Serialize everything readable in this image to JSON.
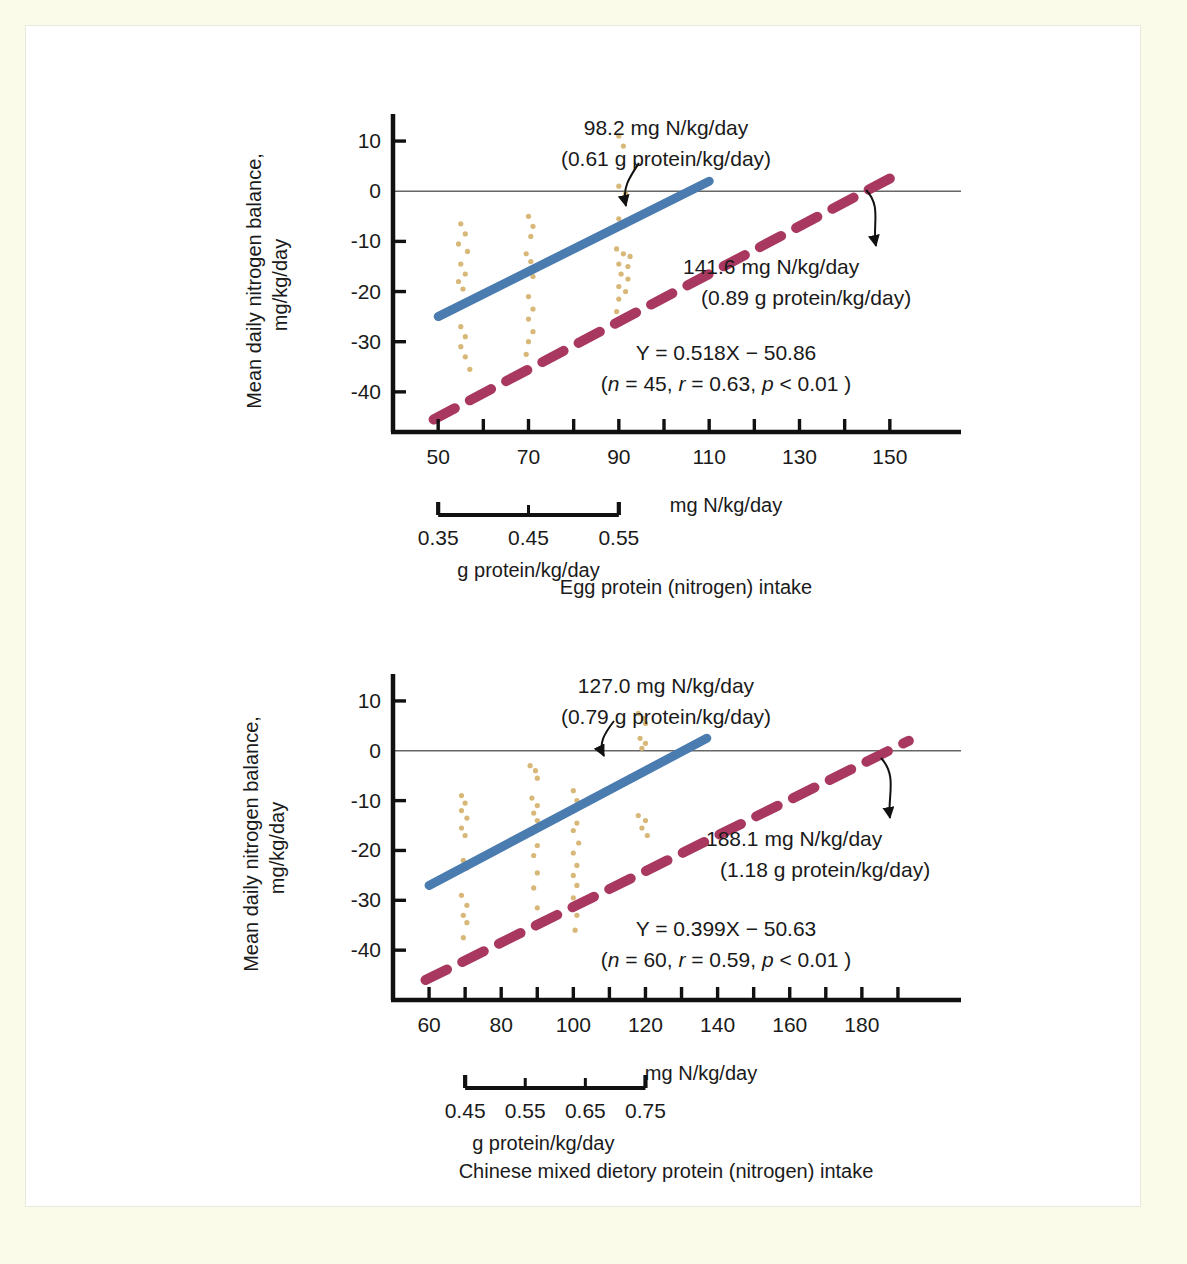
{
  "figure": {
    "background_outer": "#fbfbe9",
    "background_inner": "#ffffff",
    "colors": {
      "line_solid_blue": "#4b7cb0",
      "line_dashed_magenta": "#a8385f",
      "scatter_points": "#d8b878",
      "axis": "#111111",
      "zero_line": "#666666",
      "text": "#1a1a1a"
    }
  },
  "chart_data": [
    {
      "id": "egg-protein",
      "type": "scatter",
      "title": "",
      "caption": "Egg protein (nitrogen) intake",
      "xlabel": "mg N/kg/day",
      "ylabel": "Mean daily nitrogen balance,",
      "ylabel2": "mg/kg/day",
      "xlim": [
        40,
        160
      ],
      "ylim": [
        -48,
        14
      ],
      "x_ticks": [
        50,
        60,
        70,
        80,
        90,
        100,
        110,
        120,
        130,
        140,
        150
      ],
      "x_tick_labels": [
        "50",
        "",
        "70",
        "",
        "90",
        "",
        "110",
        "",
        "130",
        "",
        "150"
      ],
      "y_ticks": [
        10,
        0,
        -10,
        -20,
        -30,
        -40
      ],
      "y_tick_labels": [
        "10",
        "0",
        "-10",
        "-20",
        "-30",
        "-40"
      ],
      "secondary_axis": {
        "label": "g protein/kg/day",
        "ticks": [
          0.35,
          0.45,
          0.55
        ],
        "tick_labels": [
          "0.35",
          "0.45",
          "0.55"
        ],
        "x_start": 50,
        "x_end": 90
      },
      "grid": false,
      "zero_line": true,
      "series": [
        {
          "name": "regression-solid",
          "style": "solid",
          "color": "#4b7cb0",
          "x": [
            50,
            110
          ],
          "y": [
            -25.0,
            2.0
          ]
        },
        {
          "name": "regression-dashed",
          "style": "dashed",
          "color": "#a8385f",
          "x": [
            49,
            152
          ],
          "y": [
            -45.5,
            3.5
          ]
        }
      ],
      "points": [
        {
          "x": 55,
          "y": -6.5
        },
        {
          "x": 56,
          "y": -8.5
        },
        {
          "x": 54.5,
          "y": -10.5
        },
        {
          "x": 56.5,
          "y": -12.0
        },
        {
          "x": 55,
          "y": -14.5
        },
        {
          "x": 56,
          "y": -16.5
        },
        {
          "x": 54.5,
          "y": -18.0
        },
        {
          "x": 55.5,
          "y": -19.5
        },
        {
          "x": 55,
          "y": -27.0
        },
        {
          "x": 56,
          "y": -29.0
        },
        {
          "x": 55,
          "y": -31.0
        },
        {
          "x": 56,
          "y": -33.0
        },
        {
          "x": 57,
          "y": -35.5
        },
        {
          "x": 70,
          "y": -5.0
        },
        {
          "x": 71,
          "y": -7.0
        },
        {
          "x": 70.5,
          "y": -9.0
        },
        {
          "x": 69.5,
          "y": -12.5
        },
        {
          "x": 70.5,
          "y": -14.0
        },
        {
          "x": 71,
          "y": -17.0
        },
        {
          "x": 70,
          "y": -21.0
        },
        {
          "x": 71,
          "y": -23.5
        },
        {
          "x": 70,
          "y": -25.5
        },
        {
          "x": 71,
          "y": -28.0
        },
        {
          "x": 70,
          "y": -30.0
        },
        {
          "x": 69.5,
          "y": -32.5
        },
        {
          "x": 90,
          "y": 11.0
        },
        {
          "x": 91,
          "y": 9.0
        },
        {
          "x": 90,
          "y": 1.0
        },
        {
          "x": 91.5,
          "y": -0.5
        },
        {
          "x": 90,
          "y": -5.5
        },
        {
          "x": 91,
          "y": -7.0
        },
        {
          "x": 89.5,
          "y": -11.5
        },
        {
          "x": 91,
          "y": -12.5
        },
        {
          "x": 92.5,
          "y": -13.0
        },
        {
          "x": 90,
          "y": -14.5
        },
        {
          "x": 92,
          "y": -15.0
        },
        {
          "x": 90.5,
          "y": -16.5
        },
        {
          "x": 92,
          "y": -17.5
        },
        {
          "x": 90,
          "y": -19.0
        },
        {
          "x": 91.5,
          "y": -20.0
        },
        {
          "x": 90,
          "y": -21.5
        },
        {
          "x": 89.5,
          "y": -24.0
        },
        {
          "x": 91,
          "y": -25.0
        },
        {
          "x": 90,
          "y": -26.5
        }
      ],
      "annotations": [
        {
          "name": "solid-line-intercept",
          "line1": "98.2 mg N/kg/day",
          "line2": "(0.61 g protein/kg/day)"
        },
        {
          "name": "dashed-line-intercept",
          "line1": "141.6 mg N/kg/day",
          "line2": "(0.89 g protein/kg/day)"
        }
      ],
      "equation": {
        "line1": "Y = 0.518X − 50.86",
        "line2_prefix": "(",
        "n_symbol": "n",
        "n_value": " = 45, ",
        "r_symbol": "r",
        "r_value": " = 0.63, ",
        "p_symbol": "p",
        "p_value": " < 0.01 )"
      }
    },
    {
      "id": "chinese-mixed-diet",
      "type": "scatter",
      "title": "",
      "caption": "Chinese mixed dietory protein (nitrogen) intake",
      "xlabel": "mg N/kg/day",
      "ylabel": "Mean daily nitrogen balance,",
      "ylabel2": "mg/kg/day",
      "xlim": [
        50,
        200
      ],
      "ylim": [
        -50,
        14
      ],
      "x_ticks": [
        60,
        70,
        80,
        90,
        100,
        110,
        120,
        130,
        140,
        150,
        160,
        170,
        180,
        190
      ],
      "x_tick_labels": [
        "60",
        "",
        "80",
        "",
        "100",
        "",
        "120",
        "",
        "140",
        "",
        "160",
        "",
        "180",
        ""
      ],
      "y_ticks": [
        10,
        0,
        -10,
        -20,
        -30,
        -40
      ],
      "y_tick_labels": [
        "10",
        "0",
        "-10",
        "-20",
        "-30",
        "-40"
      ],
      "secondary_axis": {
        "label": "g protein/kg/day",
        "ticks": [
          0.45,
          0.55,
          0.65,
          0.75
        ],
        "tick_labels": [
          "0.45",
          "0.55",
          "0.65",
          "0.75"
        ],
        "x_start": 70,
        "x_end": 120
      },
      "grid": false,
      "zero_line": true,
      "series": [
        {
          "name": "regression-solid",
          "style": "solid",
          "color": "#4b7cb0",
          "x": [
            60,
            137
          ],
          "y": [
            -27.0,
            2.5
          ]
        },
        {
          "name": "regression-dashed",
          "style": "dashed",
          "color": "#a8385f",
          "x": [
            59,
            193
          ],
          "y": [
            -46.0,
            2.0
          ]
        }
      ],
      "points": [
        {
          "x": 69,
          "y": -9.0
        },
        {
          "x": 70,
          "y": -10.5
        },
        {
          "x": 69,
          "y": -12.0
        },
        {
          "x": 70.5,
          "y": -13.5
        },
        {
          "x": 69,
          "y": -15.5
        },
        {
          "x": 70,
          "y": -17.0
        },
        {
          "x": 69.5,
          "y": -22.0
        },
        {
          "x": 70.5,
          "y": -23.5
        },
        {
          "x": 69,
          "y": -29.0
        },
        {
          "x": 70.5,
          "y": -31.0
        },
        {
          "x": 69.5,
          "y": -33.0
        },
        {
          "x": 70.5,
          "y": -34.5
        },
        {
          "x": 69.5,
          "y": -37.5
        },
        {
          "x": 88,
          "y": -3.0
        },
        {
          "x": 89.5,
          "y": -4.0
        },
        {
          "x": 90,
          "y": -5.5
        },
        {
          "x": 88.5,
          "y": -9.5
        },
        {
          "x": 90,
          "y": -11.0
        },
        {
          "x": 89,
          "y": -12.5
        },
        {
          "x": 90,
          "y": -14.0
        },
        {
          "x": 88.5,
          "y": -16.5
        },
        {
          "x": 90,
          "y": -19.0
        },
        {
          "x": 89,
          "y": -21.0
        },
        {
          "x": 90,
          "y": -24.5
        },
        {
          "x": 89,
          "y": -27.5
        },
        {
          "x": 90,
          "y": -31.5
        },
        {
          "x": 100,
          "y": -8.0
        },
        {
          "x": 101,
          "y": -10.0
        },
        {
          "x": 100,
          "y": -12.0
        },
        {
          "x": 101,
          "y": -14.5
        },
        {
          "x": 100,
          "y": -16.0
        },
        {
          "x": 101.5,
          "y": -18.5
        },
        {
          "x": 100,
          "y": -20.5
        },
        {
          "x": 101,
          "y": -23.0
        },
        {
          "x": 100,
          "y": -25.0
        },
        {
          "x": 101,
          "y": -27.0
        },
        {
          "x": 100,
          "y": -29.5
        },
        {
          "x": 101,
          "y": -33.0
        },
        {
          "x": 100.5,
          "y": -36.0
        },
        {
          "x": 118,
          "y": 7.5
        },
        {
          "x": 119.5,
          "y": 6.5
        },
        {
          "x": 120,
          "y": 5.5
        },
        {
          "x": 118.5,
          "y": 2.5
        },
        {
          "x": 120,
          "y": 1.5
        },
        {
          "x": 119,
          "y": 0.5
        },
        {
          "x": 118,
          "y": -13.0
        },
        {
          "x": 120,
          "y": -14.0
        },
        {
          "x": 119,
          "y": -15.5
        },
        {
          "x": 120.5,
          "y": -17.0
        }
      ],
      "annotations": [
        {
          "name": "solid-line-intercept",
          "line1": "127.0 mg N/kg/day",
          "line2": "(0.79 g protein/kg/day)"
        },
        {
          "name": "dashed-line-intercept",
          "line1": "188.1 mg N/kg/day",
          "line2": "(1.18 g protein/kg/day)"
        }
      ],
      "equation": {
        "line1": "Y = 0.399X − 50.63",
        "line2_prefix": "(",
        "n_symbol": "n",
        "n_value": " = 60, ",
        "r_symbol": "r",
        "r_value": " = 0.59, ",
        "p_symbol": "p",
        "p_value": " < 0.01 )"
      }
    }
  ]
}
